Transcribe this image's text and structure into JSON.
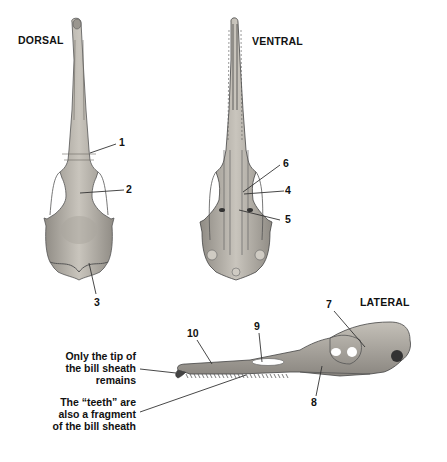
{
  "views": {
    "dorsal": "DORSAL",
    "ventral": "VENTRAL",
    "lateral": "LATERAL"
  },
  "labels": {
    "n1": "1",
    "n2": "2",
    "n3": "3",
    "n4": "4",
    "n5": "5",
    "n6": "6",
    "n7": "7",
    "n8": "8",
    "n9": "9",
    "n10": "10"
  },
  "captions": {
    "bill_tip": [
      "Only the tip of",
      "the bill sheath",
      "remains"
    ],
    "teeth": [
      "The “teeth” are",
      "also a fragment",
      "of the bill sheath"
    ]
  },
  "colors": {
    "bone_fill": "#b9b5ad",
    "bone_dark": "#6b6862",
    "line": "#333333"
  }
}
